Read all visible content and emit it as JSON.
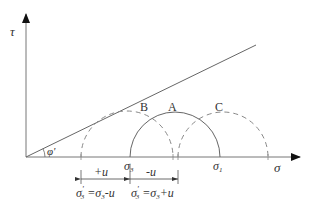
{
  "axes": {
    "y_label": "τ",
    "x_label": "σ"
  },
  "angle_label": "φ'",
  "circles": {
    "A": {
      "label": "A",
      "style": "solid"
    },
    "B": {
      "label": "B",
      "style": "dashed"
    },
    "C": {
      "label": "C",
      "style": "dashed"
    }
  },
  "tick_labels": {
    "sigma3": "σ",
    "sigma3_sub": "3",
    "sigma1": "σ",
    "sigma1_sub": "1"
  },
  "shifts": {
    "left": "+u",
    "right": "-u"
  },
  "equations": {
    "left": {
      "lhs": "σ",
      "lhs_sub": "3",
      "prime": "'",
      "rhs": " =σ",
      "rhs_sub": "3",
      "tail": "-u"
    },
    "right": {
      "lhs": "σ",
      "lhs_sub": "3",
      "prime": "'",
      "rhs": " =σ",
      "rhs_sub": "3",
      "tail": "+u"
    }
  },
  "colors": {
    "line": "#666666",
    "text": "#333333"
  }
}
